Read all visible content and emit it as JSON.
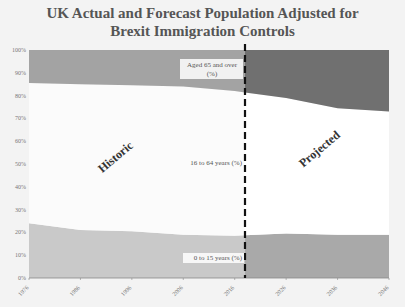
{
  "chart_data": {
    "type": "area",
    "stacked": true,
    "percent": true,
    "title": "UK Actual and Forecast Population Adjusted for Brexit Immigration Controls",
    "title_lines": [
      "UK Actual and Forecast Population Adjusted for",
      "Brexit Immigration Controls"
    ],
    "xlabel": "",
    "ylabel": "",
    "ylim": [
      0,
      100
    ],
    "yticks": [
      "0%",
      "10%",
      "20%",
      "30%",
      "40%",
      "50%",
      "60%",
      "70%",
      "80%",
      "90%",
      "100%"
    ],
    "categories": [
      "1976",
      "1986",
      "1996",
      "2006",
      "2016",
      "2026",
      "2036",
      "2046"
    ],
    "x": [
      1976,
      1986,
      1996,
      2006,
      2016,
      2026,
      2036,
      2046
    ],
    "series": [
      {
        "name": "0 to 15 years (%)",
        "values": [
          24,
          21,
          20.5,
          19,
          18.5,
          19.5,
          19,
          19
        ]
      },
      {
        "name": "16 to 64 years (%)",
        "values": [
          61.5,
          64,
          64,
          65,
          63.5,
          59.5,
          55.5,
          54
        ]
      },
      {
        "name": "Aged 65 and over (%)",
        "values": [
          14.5,
          15,
          15.5,
          16,
          18,
          21,
          25.5,
          27
        ]
      }
    ],
    "divider": {
      "x": 2018,
      "style": "dashed",
      "left_label": "Historic",
      "right_label": "Projected"
    },
    "colors": {
      "historic_0_15": "#c9c9c9",
      "projected_0_15": "#a9a9a9",
      "historic_16_64": "#fbfbfb",
      "projected_16_64": "#ffffff",
      "historic_65": "#a3a3a3",
      "projected_65": "#707070",
      "divider": "#111111"
    },
    "grid": false,
    "legend": "none (inline band labels)"
  }
}
